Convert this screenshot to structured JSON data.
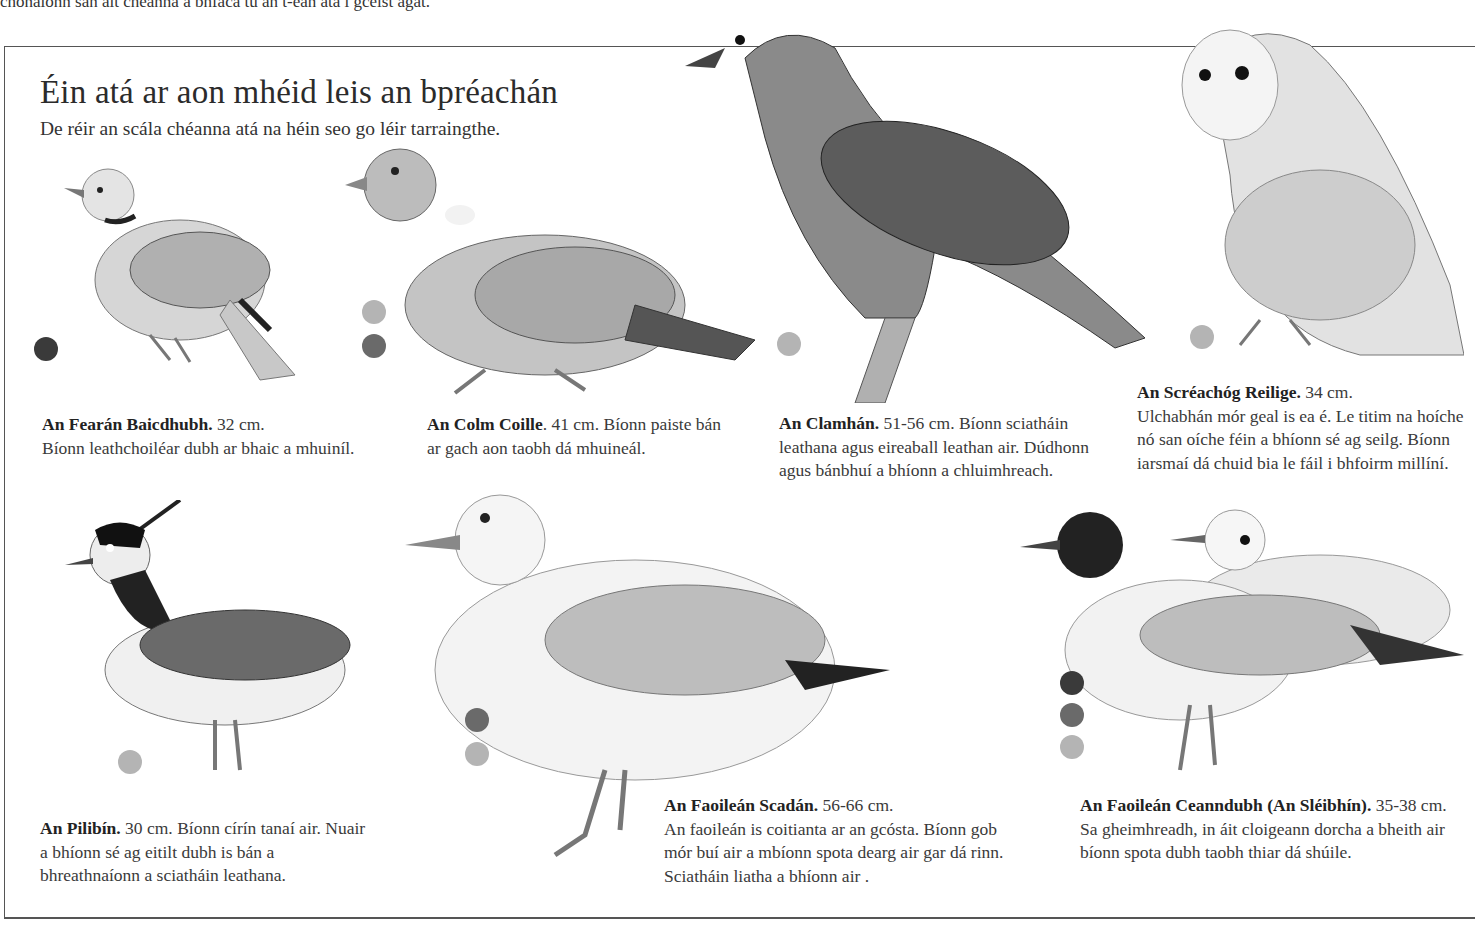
{
  "page": {
    "top_text_fragment": "chonaíonn san áit chéanna a bhfaca tú an t-éan atá i gceist agat.",
    "title": "Éin atá ar aon mhéid leis an bpréachán",
    "subtitle": "De réir an scála chéanna atá na héin seo go léir tarraingthe."
  },
  "dot_colors": {
    "dark": "#3a3a3a",
    "mid": "#6a6a6a",
    "light": "#b4b4b4"
  },
  "birds": [
    {
      "name": "An Fearán Baicdhubh.",
      "size": "32 cm.",
      "desc": "Bíonn leathchoiléar dubh ar bhaic a mhuiníl.",
      "dots": [
        "dark"
      ]
    },
    {
      "name": "An Colm Coille",
      "size": ". 41 cm.",
      "desc": "Bíonn paiste bán ar gach aon taobh dá mhuineál.",
      "dots": [
        "light",
        "mid"
      ]
    },
    {
      "name": "An Clamhán.",
      "size": "51-56 cm.",
      "desc": "Bíonn sciatháin leathana agus eireaball leathan air. Dúdhonn agus bánbhuí a bhíonn a chluimhreach.",
      "dots": [
        "light"
      ]
    },
    {
      "name": "An Scréachóg Reilige.",
      "size": "34 cm.",
      "desc": "Ulchabhán mór geal is ea é. Le titim na hoíche nó san oíche féin a bhíonn sé ag seilg. Bíonn iarsmaí dá chuid bia le fáil i bhfoirm millíní.",
      "dots": [
        "light"
      ]
    },
    {
      "name": "An Pilibín.",
      "size": "30 cm.",
      "desc": "Bíonn círín tanaí air. Nuair a bhíonn sé ag eitilt dubh is bán a bhreathnaíonn a sciatháin leathana.",
      "dots": [
        "light"
      ]
    },
    {
      "name": "An Faoileán Scadán.",
      "size": "56-66 cm.",
      "desc": "An faoileán is coitianta ar an gcósta. Bíonn gob mór buí air a mbíonn spota dearg air gar dá rinn. Sciatháin liatha a bhíonn air .",
      "dots": [
        "mid",
        "light"
      ]
    },
    {
      "name": "An Faoileán Ceanndubh (An Sléibhín).",
      "size": "35-38 cm.",
      "desc": "Sa gheimhreadh, in áit cloigeann dorcha a bheith air bíonn spota dubh taobh thiar dá shúile.",
      "dots": [
        "dark",
        "mid",
        "light"
      ]
    }
  ]
}
